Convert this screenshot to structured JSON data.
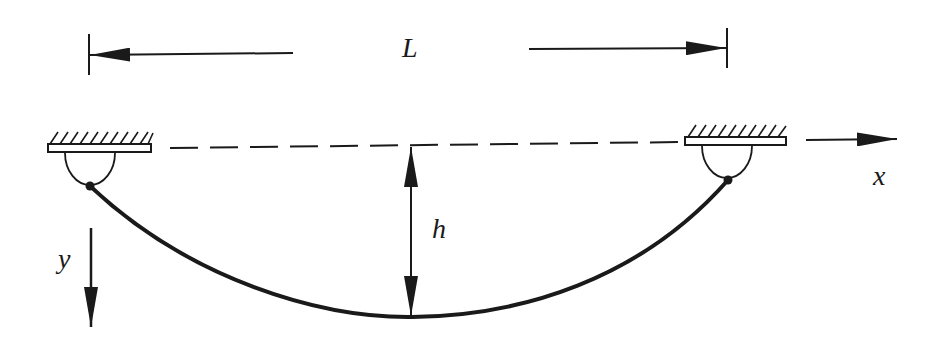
{
  "diagram": {
    "type": "catenary-cable",
    "colors": {
      "ink": "#1a1a1a",
      "background": "#ffffff"
    },
    "labels": {
      "span": "L",
      "sag": "h",
      "x_axis": "x",
      "y_axis": "y"
    },
    "supports": [
      {
        "name": "left-support",
        "ceiling_x": [
          48,
          152
        ],
        "ceiling_y": 148,
        "pin": [
          90,
          186
        ]
      },
      {
        "name": "right-support",
        "ceiling_x": [
          685,
          786
        ],
        "ceiling_y": 140,
        "pin": [
          728,
          180
        ]
      }
    ],
    "cable": {
      "start": [
        90,
        186
      ],
      "lowest": [
        412,
        317
      ],
      "end": [
        728,
        180
      ]
    },
    "dimension_span": {
      "left_x": 90,
      "right_x": 728,
      "y": 55
    },
    "dimension_sag": {
      "x": 410,
      "top_y": 148,
      "bottom_y": 317
    }
  }
}
